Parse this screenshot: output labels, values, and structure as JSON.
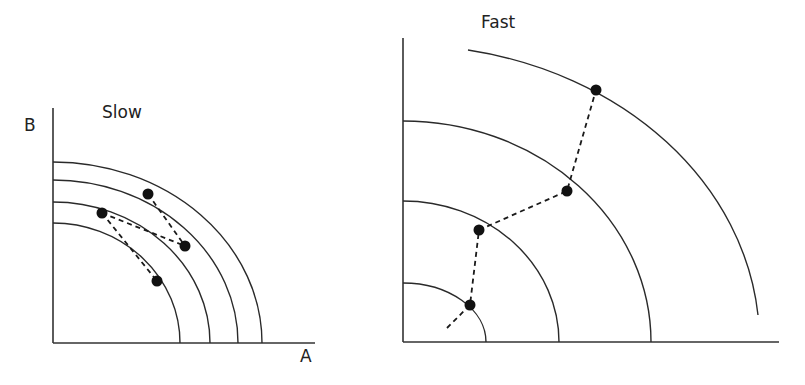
{
  "panels": [
    {
      "id": "slow",
      "title": "Slow",
      "y_axis_label": "B",
      "x_axis_label": "A",
      "frontier_count": 4,
      "path_points": 4
    },
    {
      "id": "fast",
      "title": "Fast",
      "y_axis_label": "",
      "x_axis_label": "",
      "frontier_count": 4,
      "path_points": 4
    }
  ],
  "colors": {
    "line": "#2a2a2a",
    "dot": "#111111",
    "background": "#ffffff"
  }
}
